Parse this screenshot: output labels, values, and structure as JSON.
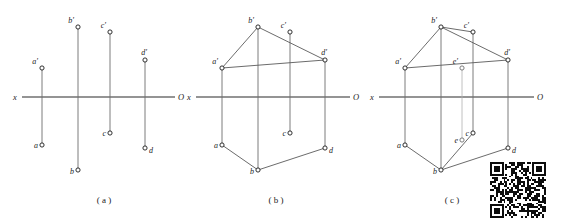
{
  "figure": {
    "kind": "orthographic-projection-diagram",
    "colors": {
      "ink": "#1a1a1a",
      "axis": "#2b2b2b",
      "projector": "#6e6e6e",
      "edge": "#5a5a5a",
      "light_edge": "#b0b0b0",
      "marker_fill": "#ffffff",
      "background": "#ffffff"
    },
    "axis": {
      "left_label": "x",
      "right_label": "O"
    },
    "panels": [
      {
        "id": "a",
        "caption": "( a )",
        "description": "Four pairs of projected points with vertical projectors crossing the x-O axis; no connecting edges.",
        "points": [
          {
            "name": "a'",
            "label": "a'",
            "x": 42,
            "y": 68
          },
          {
            "name": "b'",
            "label": "b'",
            "x": 78,
            "y": 27
          },
          {
            "name": "c'",
            "label": "c'",
            "x": 110,
            "y": 32
          },
          {
            "name": "d'",
            "label": "d'",
            "x": 145,
            "y": 60
          },
          {
            "name": "a",
            "label": "a",
            "x": 42,
            "y": 145
          },
          {
            "name": "b",
            "label": "b",
            "x": 78,
            "y": 170
          },
          {
            "name": "c",
            "label": "c",
            "x": 110,
            "y": 133
          },
          {
            "name": "d",
            "label": "d",
            "x": 145,
            "y": 148
          }
        ],
        "edges": []
      },
      {
        "id": "b",
        "caption": "( b )",
        "description": "Same points with upper outline a'-b'-d' and lower outline a-b-d drawn, plus horizontal a'-d' tie line.",
        "points": [
          {
            "name": "a'",
            "label": "a'",
            "x": 222,
            "y": 68
          },
          {
            "name": "b'",
            "label": "b'",
            "x": 258,
            "y": 27
          },
          {
            "name": "c'",
            "label": "c'",
            "x": 290,
            "y": 32
          },
          {
            "name": "d'",
            "label": "d'",
            "x": 325,
            "y": 60
          },
          {
            "name": "a",
            "label": "a",
            "x": 222,
            "y": 145
          },
          {
            "name": "b",
            "label": "b",
            "x": 258,
            "y": 170
          },
          {
            "name": "c",
            "label": "c",
            "x": 290,
            "y": 133
          },
          {
            "name": "d",
            "label": "d",
            "x": 325,
            "y": 148
          }
        ],
        "edges": [
          {
            "from": "a'",
            "to": "b'"
          },
          {
            "from": "b'",
            "to": "d'"
          },
          {
            "from": "a'",
            "to": "d'"
          },
          {
            "from": "a",
            "to": "b"
          },
          {
            "from": "b",
            "to": "d"
          }
        ]
      },
      {
        "id": "c",
        "caption": "( c )",
        "description": "Completed construction adding the crossing point e' on the frontal view and e on the horizontal view, with the b'-c' edge and the b-e-c auxiliary line.",
        "points": [
          {
            "name": "a'",
            "label": "a'",
            "x": 405,
            "y": 68
          },
          {
            "name": "b'",
            "label": "b'",
            "x": 441,
            "y": 27
          },
          {
            "name": "c'",
            "label": "c'",
            "x": 473,
            "y": 32
          },
          {
            "name": "d'",
            "label": "d'",
            "x": 508,
            "y": 60
          },
          {
            "name": "a",
            "label": "a",
            "x": 405,
            "y": 145
          },
          {
            "name": "b",
            "label": "b",
            "x": 441,
            "y": 170
          },
          {
            "name": "c",
            "label": "c",
            "x": 473,
            "y": 133
          },
          {
            "name": "d",
            "label": "d",
            "x": 508,
            "y": 148
          },
          {
            "name": "e'",
            "label": "e'",
            "x": 462,
            "y": 68
          },
          {
            "name": "e",
            "label": "e",
            "x": 462,
            "y": 140
          }
        ],
        "edges": [
          {
            "from": "a'",
            "to": "b'"
          },
          {
            "from": "b'",
            "to": "d'"
          },
          {
            "from": "b'",
            "to": "c'"
          },
          {
            "from": "a'",
            "to": "d'"
          },
          {
            "from": "a",
            "to": "b"
          },
          {
            "from": "b",
            "to": "d"
          },
          {
            "from": "b",
            "to": "c"
          }
        ]
      }
    ],
    "qr_code": {
      "name": "qr-code",
      "present": true
    }
  }
}
